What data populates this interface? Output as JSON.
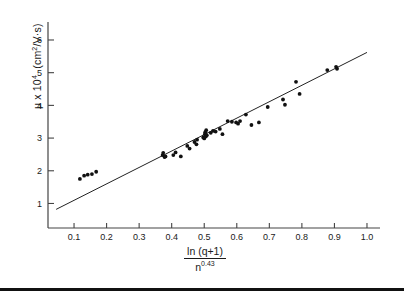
{
  "chart_data": {
    "type": "scatter",
    "title": "",
    "xlabel": "ln (q+1) / n^0.43",
    "xlabel_numerator": "ln  (q+1)",
    "xlabel_denominator_base": "n",
    "xlabel_denominator_exp": "0.43",
    "ylabel": "μ x 10⁴  (cm²/V·s)",
    "ylabel_mu": "μ x 10",
    "ylabel_exp": "4",
    "ylabel_units": "(cm",
    "ylabel_units_exp": "2",
    "ylabel_units_tail": "/V·s)",
    "xlim": [
      0.02,
      1.04
    ],
    "ylim": [
      0.25,
      6.55
    ],
    "xticks": [
      0.1,
      0.2,
      0.3,
      0.4,
      0.5,
      0.6,
      0.7,
      0.8,
      0.9,
      1.0
    ],
    "xticklabels": [
      "0.1",
      "0.2",
      "0.3",
      "0.4",
      "0.5",
      "0.6",
      "0.7",
      "0.8",
      "0.9",
      "1.0"
    ],
    "yticks": [
      1,
      2,
      3,
      4,
      5,
      6
    ],
    "yticklabels": [
      "1",
      "2",
      "3",
      "4",
      "5",
      "6"
    ],
    "grid": false,
    "legend": null,
    "marker": "filled-circle",
    "marker_color": "#111111",
    "line_color": "#222222",
    "axis_color": "#444444",
    "fit_line": {
      "name": "linear fit",
      "x": [
        0.045,
        1.0
      ],
      "y": [
        0.82,
        5.62
      ],
      "slope": 5.03,
      "intercept": 0.594
    },
    "series": [
      {
        "name": "mobility data",
        "points": [
          [
            0.118,
            1.75
          ],
          [
            0.131,
            1.85
          ],
          [
            0.142,
            1.88
          ],
          [
            0.155,
            1.9
          ],
          [
            0.168,
            1.97
          ],
          [
            0.372,
            2.48
          ],
          [
            0.374,
            2.55
          ],
          [
            0.378,
            2.42
          ],
          [
            0.381,
            2.44
          ],
          [
            0.405,
            2.48
          ],
          [
            0.412,
            2.56
          ],
          [
            0.428,
            2.44
          ],
          [
            0.448,
            2.76
          ],
          [
            0.455,
            2.68
          ],
          [
            0.47,
            2.88
          ],
          [
            0.476,
            2.81
          ],
          [
            0.478,
            2.95
          ],
          [
            0.497,
            3.02
          ],
          [
            0.5,
            2.99
          ],
          [
            0.502,
            3.12
          ],
          [
            0.503,
            3.18
          ],
          [
            0.505,
            3.05
          ],
          [
            0.506,
            3.24
          ],
          [
            0.508,
            3.09
          ],
          [
            0.52,
            3.16
          ],
          [
            0.527,
            3.22
          ],
          [
            0.535,
            3.2
          ],
          [
            0.548,
            3.28
          ],
          [
            0.556,
            3.12
          ],
          [
            0.572,
            3.52
          ],
          [
            0.585,
            3.5
          ],
          [
            0.598,
            3.48
          ],
          [
            0.604,
            3.44
          ],
          [
            0.61,
            3.52
          ],
          [
            0.628,
            3.72
          ],
          [
            0.645,
            3.4
          ],
          [
            0.668,
            3.48
          ],
          [
            0.695,
            3.95
          ],
          [
            0.742,
            4.18
          ],
          [
            0.748,
            4.02
          ],
          [
            0.782,
            4.72
          ],
          [
            0.793,
            4.35
          ],
          [
            0.878,
            5.08
          ],
          [
            0.905,
            5.18
          ],
          [
            0.908,
            5.12
          ]
        ]
      }
    ]
  },
  "figure": {
    "bottom_rule_present": true
  }
}
